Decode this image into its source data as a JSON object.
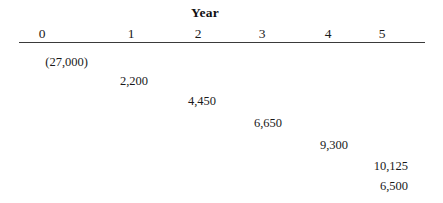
{
  "chart_data": {
    "type": "table",
    "title": "Year",
    "subtitle": "",
    "xlabel": "Year",
    "ylabel": "",
    "grid": false,
    "legend": "none",
    "axis_tick_labels": [
      "0",
      "1",
      "2",
      "3",
      "4",
      "5"
    ],
    "axis_range": [
      0,
      5
    ],
    "categories": [
      "0",
      "1",
      "2",
      "3",
      "4",
      "5",
      "5"
    ],
    "values": [
      -27000,
      2200,
      4450,
      6650,
      9300,
      10125,
      6500
    ],
    "value_labels": [
      "(27,000)",
      "2,200",
      "4,450",
      "6,650",
      "9,300",
      "10,125",
      "6,500"
    ]
  },
  "figure": {
    "title": "Year",
    "axis": {
      "ticks": [
        {
          "label": "0",
          "x": 42
        },
        {
          "label": "1",
          "x": 131
        },
        {
          "label": "2",
          "x": 198
        },
        {
          "label": "3",
          "x": 262
        },
        {
          "label": "4",
          "x": 328
        },
        {
          "label": "5",
          "x": 382
        }
      ]
    },
    "cashflows": [
      {
        "label": "(27,000)",
        "right": 355,
        "top": 55
      },
      {
        "label": "2,200",
        "right": 295,
        "top": 74
      },
      {
        "label": "4,450",
        "right": 227,
        "top": 94
      },
      {
        "label": "6,650",
        "right": 161,
        "top": 116
      },
      {
        "label": "9,300",
        "right": 95,
        "top": 138
      },
      {
        "label": "10,125",
        "right": 35,
        "top": 159
      },
      {
        "label": "6,500",
        "right": 35,
        "top": 179
      }
    ]
  },
  "colors": {
    "background": "#ffffff",
    "text": "#1a1a1a",
    "axis_line": "#3a3a3a"
  }
}
